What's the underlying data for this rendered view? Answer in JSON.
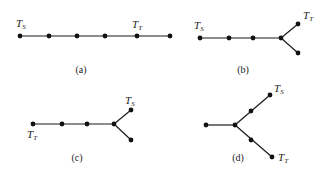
{
  "diagrams": [
    {
      "id": "a",
      "caption": "(a)",
      "source_label": {
        "main": "T",
        "sub": "S"
      },
      "target_label": {
        "main": "T",
        "sub": "T"
      },
      "description": "path of 6 nodes; T_S at node 1, T_T at node 5"
    },
    {
      "id": "b",
      "caption": "(b)",
      "source_label": {
        "main": "T",
        "sub": "S"
      },
      "target_label": {
        "main": "T",
        "sub": "T"
      },
      "description": "path of 4 nodes ending in fork of 2 leaves; T_S at start, T_T at upper leaf"
    },
    {
      "id": "c",
      "caption": "(c)",
      "source_label": {
        "main": "T",
        "sub": "S"
      },
      "target_label": {
        "main": "T",
        "sub": "T"
      },
      "description": "path of 4 nodes ending in fork of 2 leaves; T_T at start, T_S at upper leaf"
    },
    {
      "id": "d",
      "caption": "(d)",
      "source_label": {
        "main": "T",
        "sub": "S"
      },
      "target_label": {
        "main": "T",
        "sub": "T"
      },
      "description": "hub with one short arm and two 2-edge arms; T_S at upper arm end, T_T at lower arm end"
    }
  ]
}
